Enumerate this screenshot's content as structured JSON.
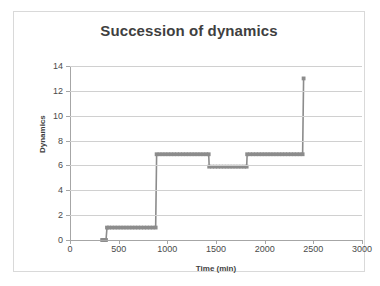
{
  "chart_data": {
    "type": "line",
    "title": "Succession of dynamics",
    "xlabel": "Time (min)",
    "ylabel": "Dynamics",
    "xlim": [
      0,
      3000
    ],
    "ylim": [
      0,
      14
    ],
    "xticks": [
      0,
      500,
      1000,
      1500,
      2000,
      2500,
      3000
    ],
    "yticks": [
      0,
      2,
      4,
      6,
      8,
      10,
      12,
      14
    ],
    "grid": "horizontal",
    "legend": "none",
    "series_color": "#8c8c8c",
    "marker": "square",
    "series": [
      {
        "name": "Dynamics",
        "points": [
          [
            330,
            0
          ],
          [
            340,
            0
          ],
          [
            350,
            0
          ],
          [
            360,
            0
          ],
          [
            370,
            0
          ],
          [
            380,
            1
          ],
          [
            400,
            1
          ],
          [
            430,
            1
          ],
          [
            460,
            1
          ],
          [
            490,
            1
          ],
          [
            520,
            1
          ],
          [
            550,
            1
          ],
          [
            580,
            1
          ],
          [
            610,
            1
          ],
          [
            640,
            1
          ],
          [
            670,
            1
          ],
          [
            700,
            1
          ],
          [
            730,
            1
          ],
          [
            760,
            1
          ],
          [
            790,
            1
          ],
          [
            820,
            1
          ],
          [
            850,
            1
          ],
          [
            880,
            1
          ],
          [
            890,
            6.9
          ],
          [
            920,
            6.9
          ],
          [
            950,
            6.9
          ],
          [
            980,
            6.9
          ],
          [
            1010,
            6.9
          ],
          [
            1040,
            6.9
          ],
          [
            1070,
            6.9
          ],
          [
            1100,
            6.9
          ],
          [
            1130,
            6.9
          ],
          [
            1160,
            6.9
          ],
          [
            1190,
            6.9
          ],
          [
            1220,
            6.9
          ],
          [
            1250,
            6.9
          ],
          [
            1280,
            6.9
          ],
          [
            1310,
            6.9
          ],
          [
            1340,
            6.9
          ],
          [
            1370,
            6.9
          ],
          [
            1400,
            6.9
          ],
          [
            1425,
            6.9
          ],
          [
            1430,
            5.9
          ],
          [
            1460,
            5.9
          ],
          [
            1490,
            5.9
          ],
          [
            1520,
            5.9
          ],
          [
            1550,
            5.9
          ],
          [
            1580,
            5.9
          ],
          [
            1610,
            5.9
          ],
          [
            1640,
            5.9
          ],
          [
            1670,
            5.9
          ],
          [
            1700,
            5.9
          ],
          [
            1730,
            5.9
          ],
          [
            1760,
            5.9
          ],
          [
            1790,
            5.9
          ],
          [
            1815,
            5.9
          ],
          [
            1820,
            6.9
          ],
          [
            1850,
            6.9
          ],
          [
            1880,
            6.9
          ],
          [
            1910,
            6.9
          ],
          [
            1940,
            6.9
          ],
          [
            1970,
            6.9
          ],
          [
            2000,
            6.9
          ],
          [
            2030,
            6.9
          ],
          [
            2060,
            6.9
          ],
          [
            2090,
            6.9
          ],
          [
            2120,
            6.9
          ],
          [
            2150,
            6.9
          ],
          [
            2180,
            6.9
          ],
          [
            2210,
            6.9
          ],
          [
            2240,
            6.9
          ],
          [
            2270,
            6.9
          ],
          [
            2300,
            6.9
          ],
          [
            2330,
            6.9
          ],
          [
            2360,
            6.9
          ],
          [
            2390,
            6.9
          ],
          [
            2400,
            13
          ]
        ]
      }
    ]
  }
}
